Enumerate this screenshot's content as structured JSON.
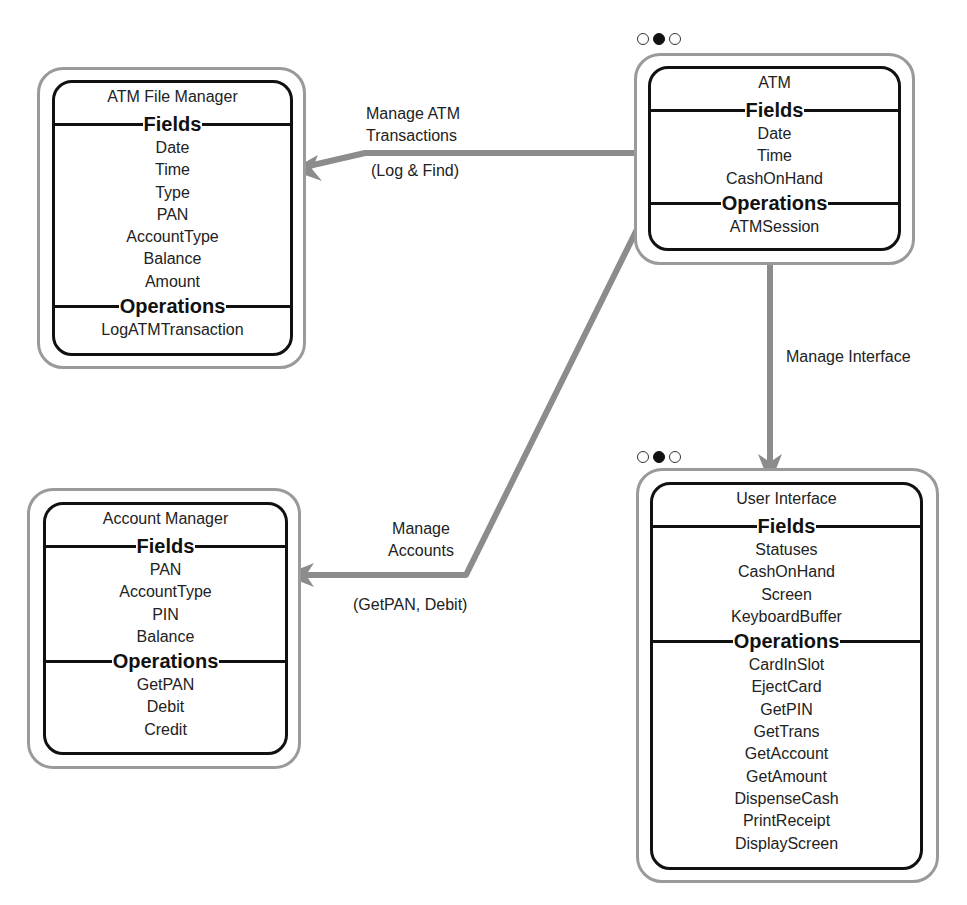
{
  "diagram": {
    "type": "object-model",
    "objects": [
      {
        "id": "atm_file_manager",
        "title": "ATM File Manager",
        "fields_label": "Fields",
        "fields": [
          "Date",
          "Time",
          "Type",
          "PAN",
          "AccountType",
          "Balance",
          "Amount"
        ],
        "operations_label": "Operations",
        "operations": [
          "LogATMTransaction"
        ]
      },
      {
        "id": "atm",
        "title": "ATM",
        "fields_label": "Fields",
        "fields": [
          "Date",
          "Time",
          "CashOnHand"
        ],
        "operations_label": "Operations",
        "operations": [
          "ATMSession"
        ],
        "indicator": [
          "empty",
          "filled",
          "empty"
        ]
      },
      {
        "id": "account_manager",
        "title": "Account Manager",
        "fields_label": "Fields",
        "fields": [
          "PAN",
          "AccountType",
          "PIN",
          "Balance"
        ],
        "operations_label": "Operations",
        "operations": [
          "GetPAN",
          "Debit",
          "Credit"
        ]
      },
      {
        "id": "user_interface",
        "title": "User Interface",
        "fields_label": "Fields",
        "fields": [
          "Statuses",
          "CashOnHand",
          "Screen",
          "KeyboardBuffer"
        ],
        "operations_label": "Operations",
        "operations": [
          "CardInSlot",
          "EjectCard",
          "GetPIN",
          "GetTrans",
          "GetAccount",
          "GetAmount",
          "DispenseCash",
          "PrintReceipt",
          "DisplayScreen"
        ],
        "indicator": [
          "empty",
          "filled",
          "empty"
        ]
      }
    ],
    "connections": [
      {
        "from": "ATM",
        "to": "ATM File Manager",
        "label_line1": "Manage ATM",
        "label_line2": "Transactions",
        "sub_label": "(Log & Find)"
      },
      {
        "from": "ATM",
        "to": "Account Manager",
        "label_line1": "Manage",
        "label_line2": "Accounts",
        "sub_label": "(GetPAN, Debit)"
      },
      {
        "from": "ATM",
        "to": "User Interface",
        "label_line1": "Manage Interface"
      }
    ],
    "colors": {
      "connector": "#8c8c8c",
      "outer_border": "#9a9a9a",
      "inner_border": "#111111",
      "text": "#222222"
    }
  }
}
